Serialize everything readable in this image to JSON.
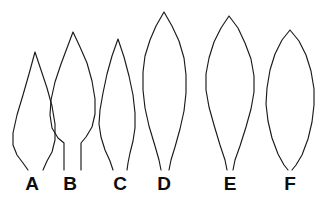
{
  "figure": {
    "background_color": "#ffffff",
    "stroke_color": "#1a1a1a",
    "label_color": "#0d0d0d",
    "width": 324,
    "height": 198
  },
  "specimens": [
    {
      "label": "A",
      "shape_name": "narrow-lanceolate-leaf",
      "label_x": 32,
      "label_y": 190,
      "outline": "M 35 52 L 29 74 L 23 95 L 17 115 L 13 133 L 13 145 L 17 155 L 23 163 L 28 170 M 35 52 L 41 70 L 47 88 L 52 106 L 55 124 L 55 140 L 52 152 L 47 161 L 43 170"
    },
    {
      "label": "B",
      "shape_name": "ovate-lanceolate-leaf-with-petiole",
      "label_x": 70,
      "label_y": 190,
      "outline": "M 73 32 L 67 48 L 61 64 L 55 82 L 51 100 L 50 115 L 52 128 L 58 138 L 64 143 L 64 170 M 73 32 L 80 47 L 87 63 L 92 81 L 95 99 L 95 114 L 92 127 L 86 137 L 81 143 L 81 170"
    },
    {
      "label": "C",
      "shape_name": "narrow-elliptic-leaf",
      "label_x": 120,
      "label_y": 190,
      "outline": "M 118 39 L 112 56 L 107 74 L 103 93 L 100 110 L 99 124 L 101 137 L 105 150 L 110 161 L 113 170 M 118 39 L 124 57 L 129 76 L 133 95 L 135 113 L 135 128 L 133 141 L 130 153 L 128 163 L 127 170"
    },
    {
      "label": "D",
      "shape_name": "broad-ovate-acuminate-leaf",
      "label_x": 164,
      "label_y": 190,
      "outline": "M 164 12 L 156 26 L 150 40 L 145 56 L 143 72 L 143 90 L 145 108 L 149 126 L 155 146 L 159 160 L 161 170 M 164 12 L 172 26 L 179 41 L 184 58 L 186 75 L 186 93 L 184 111 L 180 129 L 175 147 L 171 160 L 169 170"
    },
    {
      "label": "E",
      "shape_name": "broad-rhombic-ovate-leaf",
      "label_x": 230,
      "label_y": 190,
      "outline": "M 229 16 L 221 28 L 214 42 L 209 58 L 206 74 L 206 90 L 209 107 L 214 125 L 220 145 L 225 160 L 227 170 M 229 16 L 238 28 L 245 43 L 251 59 L 254 76 L 254 92 L 251 109 L 246 127 L 240 146 L 235 160 L 233 170"
    },
    {
      "label": "F",
      "shape_name": "elliptic-lens-shaped-leaf",
      "label_x": 290,
      "label_y": 190,
      "outline": "M 290 30 L 282 40 L 275 54 L 270 70 L 267 88 L 266 104 L 268 121 L 272 138 L 278 154 L 284 165 L 288 170 M 290 30 L 299 41 L 306 55 L 311 71 L 314 89 L 314 105 L 312 122 L 308 139 L 302 155 L 296 165 L 292 170"
    }
  ]
}
